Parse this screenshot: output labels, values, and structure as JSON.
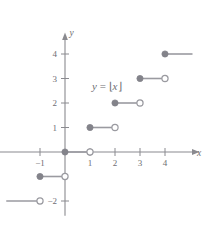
{
  "chart_data": {
    "type": "line",
    "title": "",
    "subtitle": "",
    "function_label": "y = ⌊x⌋",
    "xlabel": "x",
    "ylabel": "y",
    "xlim": [
      -2.6,
      5.4
    ],
    "ylim": [
      -2.6,
      4.9
    ],
    "grid": false,
    "legend": "none",
    "x_ticks": [
      {
        "value": -1,
        "label": "−1"
      },
      {
        "value": 1,
        "label": "1"
      },
      {
        "value": 2,
        "label": "2"
      },
      {
        "value": 3,
        "label": "3"
      },
      {
        "value": 4,
        "label": "4"
      }
    ],
    "y_ticks": [
      {
        "value": 4,
        "label": "4"
      },
      {
        "value": 3,
        "label": "3"
      },
      {
        "value": 2,
        "label": "2"
      },
      {
        "value": 1,
        "label": "1"
      },
      {
        "value": -2,
        "label": "−2"
      }
    ],
    "series": [
      {
        "name": "floor",
        "steps": [
          {
            "y": -2,
            "x_start": -2.35,
            "x_end": -1,
            "left_endpoint": "none",
            "right_endpoint": "open"
          },
          {
            "y": -1,
            "x_start": -1,
            "x_end": 0,
            "left_endpoint": "filled",
            "right_endpoint": "open"
          },
          {
            "y": 0,
            "x_start": 0,
            "x_end": 1,
            "left_endpoint": "filled",
            "right_endpoint": "open"
          },
          {
            "y": 1,
            "x_start": 1,
            "x_end": 2,
            "left_endpoint": "filled",
            "right_endpoint": "open"
          },
          {
            "y": 2,
            "x_start": 2,
            "x_end": 3,
            "left_endpoint": "filled",
            "right_endpoint": "open"
          },
          {
            "y": 3,
            "x_start": 3,
            "x_end": 4,
            "left_endpoint": "filled",
            "right_endpoint": "open"
          },
          {
            "y": 4,
            "x_start": 4,
            "x_end": 5.1,
            "left_endpoint": "filled",
            "right_endpoint": "none"
          }
        ]
      }
    ],
    "colors": {
      "axis": "#8a8a8f",
      "curve": "#9a9aa0",
      "marker_fill": "#83838a",
      "marker_open_fill": "#ffffff",
      "text": "#6e6e72",
      "background": "#ffffff"
    }
  },
  "geometry": {
    "origin_x": 65,
    "origin_y": 152,
    "unit_x": 25,
    "unit_y": 24.5,
    "tick_len": 4,
    "marker_r": 3.1
  }
}
